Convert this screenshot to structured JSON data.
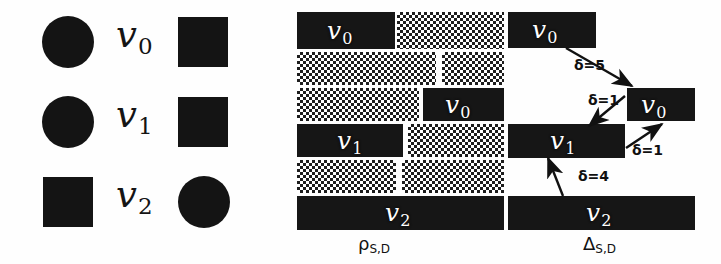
{
  "figure": {
    "background_color": "#fefefe",
    "ink_color": "#141414",
    "label_color": "#ffffff"
  },
  "legend_panel": {
    "name": "vertex-shape-legend",
    "rows": [
      {
        "label": "v",
        "subscript": "0",
        "left_glyph": "circle",
        "right_glyph": "square",
        "left_glyph_name": "filled-circle-icon",
        "right_glyph_name": "filled-square-icon"
      },
      {
        "label": "v",
        "subscript": "1",
        "left_glyph": "circle",
        "right_glyph": "square",
        "left_glyph_name": "filled-circle-icon",
        "right_glyph_name": "filled-square-icon"
      },
      {
        "label": "v",
        "subscript": "2",
        "left_glyph": "square",
        "right_glyph": "circle",
        "left_glyph_name": "filled-square-icon",
        "right_glyph_name": "filled-circle-icon"
      }
    ]
  },
  "rho_panel": {
    "caption": "ρ",
    "caption_subscript": "S,D",
    "caption_name": "rho-s-d-caption",
    "rows": [
      {
        "index": 0,
        "segments": [
          {
            "fill": "solid",
            "label": "v",
            "subscript": "0"
          },
          {
            "fill": "dither",
            "label": "",
            "subscript": ""
          }
        ]
      },
      {
        "index": 1,
        "segments": [
          {
            "fill": "dither",
            "label": "",
            "subscript": ""
          },
          {
            "fill": "dither",
            "label": "",
            "subscript": ""
          }
        ]
      },
      {
        "index": 2,
        "segments": [
          {
            "fill": "dither",
            "label": "",
            "subscript": ""
          },
          {
            "fill": "solid",
            "label": "v",
            "subscript": "0"
          }
        ]
      },
      {
        "index": 3,
        "segments": [
          {
            "fill": "solid",
            "label": "v",
            "subscript": "1"
          },
          {
            "fill": "dither",
            "label": "",
            "subscript": ""
          }
        ]
      },
      {
        "index": 4,
        "segments": [
          {
            "fill": "dither",
            "label": "",
            "subscript": ""
          },
          {
            "fill": "dither",
            "label": "",
            "subscript": ""
          }
        ]
      },
      {
        "index": 5,
        "segments": [
          {
            "fill": "solid",
            "label": "v",
            "subscript": "2"
          }
        ]
      }
    ]
  },
  "delta_panel": {
    "caption": "Δ",
    "caption_subscript": "S,D",
    "caption_name": "delta-s-d-caption",
    "bars": [
      {
        "id": "v0-top",
        "label": "v",
        "subscript": "0"
      },
      {
        "id": "v0-right",
        "label": "v",
        "subscript": "0"
      },
      {
        "id": "v1-middle",
        "label": "v",
        "subscript": "1"
      },
      {
        "id": "v2-bottom",
        "label": "v",
        "subscript": "2"
      }
    ],
    "arrows": [
      {
        "id": "arrow-v0top-to-v0right",
        "delta_text": "δ=5",
        "from": "v0-top",
        "to": "v0-right"
      },
      {
        "id": "arrow-v0right-to-v1",
        "delta_text": "δ=1",
        "from": "v0-right",
        "to": "v1-middle"
      },
      {
        "id": "arrow-v1-to-v0right",
        "delta_text": "δ=1",
        "from": "v1-middle",
        "to": "v0-right"
      },
      {
        "id": "arrow-v2-to-v1",
        "delta_text": "δ=4",
        "from": "v2-bottom",
        "to": "v1-middle"
      }
    ]
  }
}
